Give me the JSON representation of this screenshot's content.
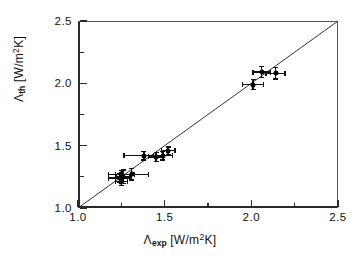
{
  "chart_data": {
    "type": "scatter",
    "title": "",
    "xlabel": "Λ_exp [W/m²K]",
    "ylabel": "Λ_th [W/m²K]",
    "xlabel_symbol": "Λ",
    "xlabel_sub": "exp",
    "xlabel_units": "[W/m",
    "xlabel_sup": "2",
    "xlabel_units_end": "K]",
    "ylabel_symbol": "Λ",
    "ylabel_sub": "th",
    "ylabel_units": "[W/m",
    "ylabel_sup": "2",
    "ylabel_units_end": "K]",
    "xlim": [
      1.0,
      2.5
    ],
    "ylim": [
      1.0,
      2.5
    ],
    "xticks": [
      1.0,
      1.5,
      2.0,
      2.5
    ],
    "yticks": [
      1.0,
      1.5,
      2.0,
      2.5
    ],
    "xtick_labels": [
      "1.0",
      "1.5",
      "2.0",
      "2.5"
    ],
    "ytick_labels": [
      "1.0",
      "1.5",
      "2.0",
      "2.5"
    ],
    "xminor_ticks": [
      1.25,
      1.75,
      2.25
    ],
    "yminor_ticks": [
      1.25,
      1.75,
      2.25
    ],
    "grid": false,
    "legend": null,
    "marker": "filled-circle",
    "marker_color": "#000000",
    "line_color": "#333333",
    "reference_line": {
      "name": "one-to-one-line",
      "from": [
        1.0,
        1.0
      ],
      "to": [
        2.5,
        2.5
      ],
      "slope": 1,
      "intercept": 0
    },
    "points": [
      {
        "x": 1.24,
        "y": 1.24,
        "xerr": 0.065,
        "yerr": 0.035
      },
      {
        "x": 1.25,
        "y": 1.21,
        "xerr": 0.035,
        "yerr": 0.03
      },
      {
        "x": 1.25,
        "y": 1.27,
        "xerr": 0.075,
        "yerr": 0.03
      },
      {
        "x": 1.26,
        "y": 1.25,
        "xerr": 0.04,
        "yerr": 0.055
      },
      {
        "x": 1.31,
        "y": 1.27,
        "xerr": 0.095,
        "yerr": 0.045
      },
      {
        "x": 1.38,
        "y": 1.42,
        "xerr": 0.115,
        "yerr": 0.035
      },
      {
        "x": 1.45,
        "y": 1.41,
        "xerr": 0.045,
        "yerr": 0.035
      },
      {
        "x": 1.49,
        "y": 1.42,
        "xerr": 0.055,
        "yerr": 0.035
      },
      {
        "x": 1.52,
        "y": 1.46,
        "xerr": 0.04,
        "yerr": 0.03
      },
      {
        "x": 2.01,
        "y": 1.99,
        "xerr": 0.06,
        "yerr": 0.04
      },
      {
        "x": 2.06,
        "y": 2.09,
        "xerr": 0.05,
        "yerr": 0.045
      },
      {
        "x": 2.14,
        "y": 2.08,
        "xerr": 0.055,
        "yerr": 0.045
      }
    ]
  }
}
